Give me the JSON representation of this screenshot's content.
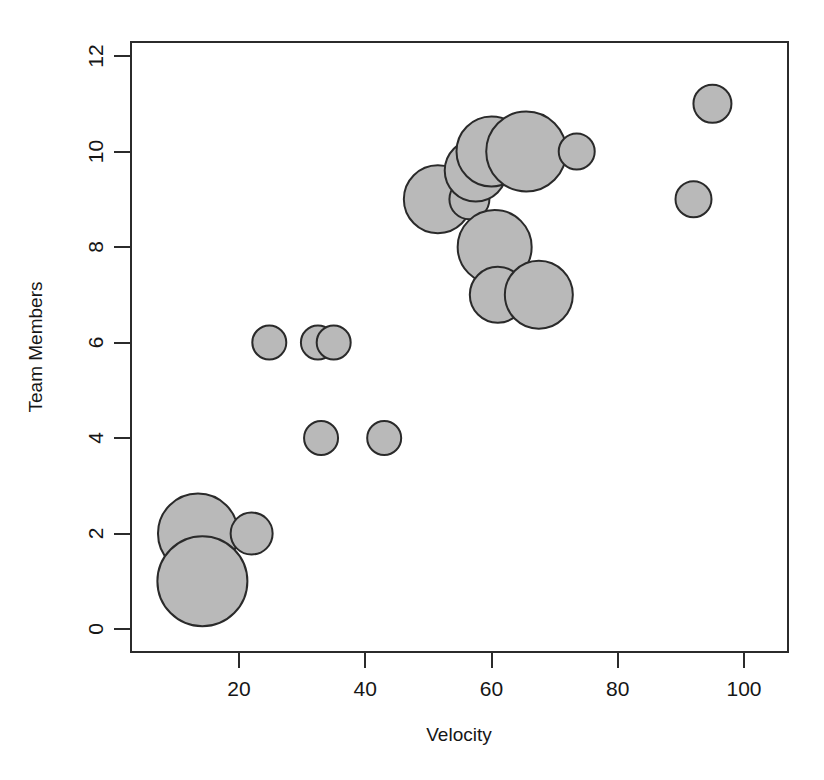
{
  "chart_data": {
    "type": "scatter",
    "variant": "bubble",
    "title": "",
    "xlabel": "Velocity",
    "ylabel": "Team Members",
    "xlim": [
      3,
      107
    ],
    "ylim": [
      -0.45,
      12.4
    ],
    "xticks": [
      20,
      40,
      60,
      80,
      100
    ],
    "yticks": [
      0,
      2,
      4,
      6,
      8,
      10,
      12
    ],
    "grid": false,
    "legend": null,
    "marker_fill": "#b9b9b9",
    "marker_edge": "#2a2a2a",
    "x": [
      13.5,
      14.2,
      22.0,
      24.8,
      32.5,
      35.0,
      33.0,
      43.0,
      51.5,
      56.5,
      57.5,
      60.0,
      65.5,
      73.5,
      60.5,
      61.0,
      67.5,
      92.0,
      95.0
    ],
    "y": [
      2,
      1,
      2,
      6,
      6,
      6,
      4,
      4,
      9,
      9,
      9.6,
      10,
      10,
      10,
      8,
      7,
      7,
      9,
      11
    ],
    "sizes": [
      40,
      45,
      21,
      17,
      17,
      17,
      17,
      17,
      34,
      20,
      31,
      35,
      40,
      18,
      37,
      28,
      34,
      18,
      19
    ],
    "points": [
      {
        "x": 13.5,
        "y": 2,
        "r": 40
      },
      {
        "x": 14.2,
        "y": 1,
        "r": 45
      },
      {
        "x": 22.0,
        "y": 2,
        "r": 21
      },
      {
        "x": 24.8,
        "y": 6,
        "r": 17
      },
      {
        "x": 32.5,
        "y": 6,
        "r": 17
      },
      {
        "x": 35.0,
        "y": 6,
        "r": 17
      },
      {
        "x": 33.0,
        "y": 4,
        "r": 17
      },
      {
        "x": 43.0,
        "y": 4,
        "r": 17
      },
      {
        "x": 51.5,
        "y": 9,
        "r": 34
      },
      {
        "x": 56.5,
        "y": 9,
        "r": 20
      },
      {
        "x": 57.5,
        "y": 9.6,
        "r": 31
      },
      {
        "x": 60.0,
        "y": 10,
        "r": 35
      },
      {
        "x": 65.5,
        "y": 10,
        "r": 40
      },
      {
        "x": 73.5,
        "y": 10,
        "r": 18
      },
      {
        "x": 60.5,
        "y": 8,
        "r": 37
      },
      {
        "x": 61.0,
        "y": 7,
        "r": 28
      },
      {
        "x": 67.5,
        "y": 7,
        "r": 34
      },
      {
        "x": 92.0,
        "y": 9,
        "r": 18
      },
      {
        "x": 95.0,
        "y": 11,
        "r": 19
      }
    ]
  },
  "axes": {
    "x_tick_labels": [
      "20",
      "40",
      "60",
      "80",
      "100"
    ],
    "y_tick_labels": [
      "0",
      "2",
      "4",
      "6",
      "8",
      "10",
      "12"
    ],
    "x_axis_title": "Velocity",
    "y_axis_title": "Team Members"
  }
}
